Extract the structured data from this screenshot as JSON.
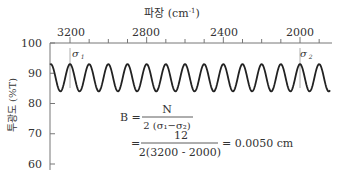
{
  "chart_data": {
    "type": "line",
    "title": "",
    "xlabel": "파장 (cm⁻¹)",
    "xlabel_main": "파장 (cm",
    "xlabel_sup": "-1",
    "xlabel_close": ")",
    "ylabel": "투광도 (%T)",
    "x_axis_position": "top",
    "x_reversed": true,
    "xlim": [
      3260,
      1930
    ],
    "ylim": [
      58,
      100
    ],
    "x_ticks": [
      3200,
      2800,
      2400,
      2000
    ],
    "x_tick_labels": [
      "3200",
      "2800",
      "2400",
      "2000"
    ],
    "x_minor_step": 100,
    "y_ticks": [
      100,
      90,
      80,
      70,
      60
    ],
    "y_tick_labels": [
      "100",
      "90",
      "80",
      "70",
      "60"
    ],
    "grid": false,
    "series": [
      {
        "name": "interference fringes",
        "description": "sinusoidal transmittance oscillation",
        "y_max": 93,
        "y_min": 84,
        "fringes_between_markers": 12,
        "x_start": 3260,
        "x_end": 1945,
        "color": "#222222"
      }
    ],
    "annotations": [
      {
        "label": "σ",
        "sub": "1",
        "x": 3200
      },
      {
        "label": "σ",
        "sub": "2",
        "x": 2000
      }
    ],
    "formula": {
      "line1_lhs": "B =",
      "line1_num": "N",
      "line1_den": "2 (σ₁−σ₂)",
      "line2_lhs": "=",
      "line2_num": "12",
      "line2_den": "2(3200 - 2000)",
      "line2_rhs": "= 0.0050 cm"
    }
  }
}
